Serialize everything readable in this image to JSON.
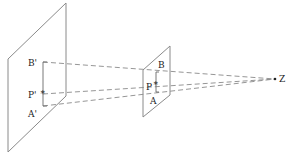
{
  "diagram": {
    "title": "",
    "labels": {
      "b_prime": "B'",
      "p_prime": "P'",
      "a_prime": "A'",
      "b": "B",
      "p": "P",
      "a": "A",
      "z": "Z"
    },
    "marker_glyph": "*",
    "colors": {
      "line": "#8a8a8a",
      "text": "#222222"
    }
  }
}
